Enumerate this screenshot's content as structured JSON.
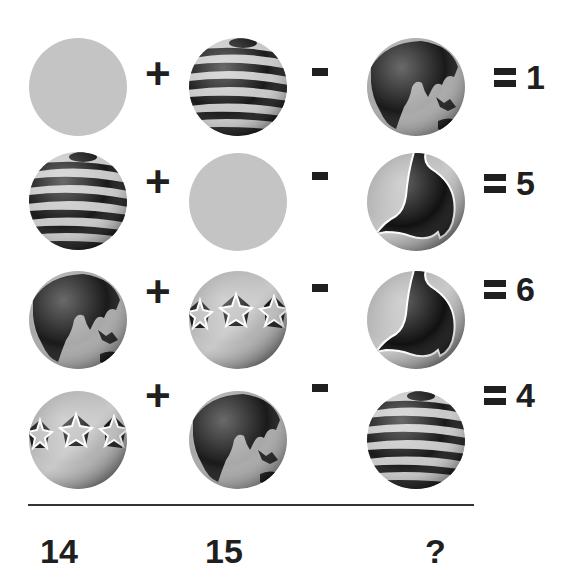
{
  "puzzle": {
    "rows": [
      {
        "terms": [
          "plain-gray-ball",
          "striped-ball",
          "globe-ball"
        ],
        "operators": [
          "+",
          "-"
        ],
        "result": "1"
      },
      {
        "terms": [
          "striped-ball",
          "plain-gray-ball",
          "eagle-ball"
        ],
        "operators": [
          "+",
          "-"
        ],
        "result": "5"
      },
      {
        "terms": [
          "globe-ball",
          "stars-ball",
          "eagle-ball"
        ],
        "operators": [
          "+",
          "-"
        ],
        "result": "6"
      },
      {
        "terms": [
          "stars-ball",
          "globe-ball",
          "striped-ball"
        ],
        "operators": [
          "+",
          "-"
        ],
        "result": "4"
      }
    ],
    "column_answers": [
      "14",
      "15",
      "?"
    ]
  },
  "colors": {
    "ink": "#1f1f1f",
    "gray_ball": "#c4c4c4",
    "stripe_dark": "#1a1a1a",
    "stripe_light": "#c8c8c8"
  }
}
